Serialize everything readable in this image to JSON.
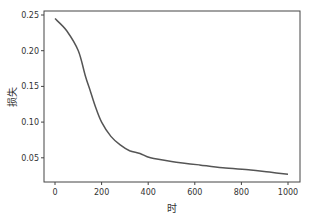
{
  "chart_data": {
    "type": "line",
    "title": "",
    "xlabel": "时",
    "ylabel": "损失",
    "xlim": [
      -50,
      1050
    ],
    "ylim": [
      0.015,
      0.255
    ],
    "x_ticks": [
      0,
      200,
      400,
      600,
      800,
      1000
    ],
    "x_tick_labels": [
      "0",
      "200",
      "400",
      "600",
      "800",
      "1000"
    ],
    "y_ticks": [
      0.05,
      0.1,
      0.15,
      0.2,
      0.25
    ],
    "y_tick_labels": [
      "0.05",
      "0.10",
      "0.15",
      "0.20",
      "0.25"
    ],
    "grid": false,
    "legend": null,
    "series": [
      {
        "name": "loss",
        "color": "#555555",
        "x": [
          0,
          50,
          100,
          130,
          150,
          175,
          200,
          240,
          280,
          320,
          365,
          410,
          500,
          620,
          720,
          840,
          920,
          1000
        ],
        "values": [
          0.245,
          0.228,
          0.2,
          0.165,
          0.145,
          0.12,
          0.1,
          0.08,
          0.068,
          0.06,
          0.056,
          0.05,
          0.045,
          0.04,
          0.036,
          0.033,
          0.03,
          0.027
        ]
      }
    ]
  }
}
